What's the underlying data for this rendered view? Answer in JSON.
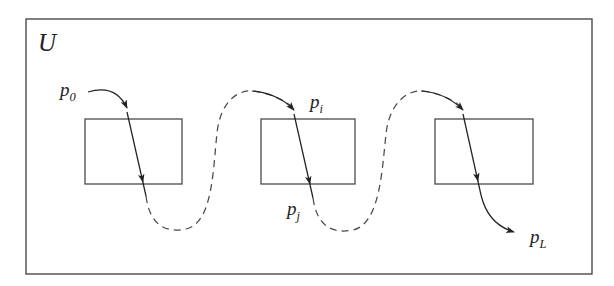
{
  "figure": {
    "type": "diagram",
    "background_color": "#ffffff",
    "stroke_color": "#222222",
    "outer_region": {
      "label": "U",
      "label_x": 38,
      "label_y": 51,
      "x": 26,
      "y": 19,
      "width": 566,
      "height": 255
    },
    "boxes": [
      {
        "name": "box-1",
        "x": 85,
        "y": 119,
        "width": 97,
        "height": 65
      },
      {
        "name": "box-2",
        "x": 261,
        "y": 119,
        "width": 94,
        "height": 65
      },
      {
        "name": "box-3",
        "x": 435,
        "y": 119,
        "width": 98,
        "height": 65
      }
    ],
    "point_labels": [
      {
        "name": "p0",
        "base": "p",
        "sub": "0",
        "x": 60,
        "y": 96
      },
      {
        "name": "pi",
        "base": "p",
        "sub": "i",
        "x": 310,
        "y": 108
      },
      {
        "name": "pj",
        "base": "p",
        "sub": "j",
        "x": 287,
        "y": 215
      },
      {
        "name": "pL",
        "base": "p",
        "sub": "L",
        "x": 530,
        "y": 243
      }
    ],
    "path_segments": [
      {
        "name": "entry-curve-1",
        "style": "solid",
        "d": "M 88 92 C 108 86 120 93 127 108",
        "arrowhead": {
          "x": 129,
          "y": 117,
          "angle": 68
        }
      },
      {
        "name": "crossing-1",
        "style": "solid",
        "d": "M 127 108 L 146 196",
        "arrowhead": {
          "x": 142,
          "y": 177,
          "angle": 78
        }
      },
      {
        "name": "dashed-loop-1",
        "style": "dashed",
        "d": "M 146 196 C 150 226 166 233 186 229 C 213 223 213 169 217 133 C 220 104 236 89 254 91 C 268 93 283 99 294 110"
      },
      {
        "name": "crossing-2",
        "style": "solid",
        "d": "M 294 110 L 313 198",
        "arrowhead": {
          "x": 309,
          "y": 179,
          "angle": 78
        }
      },
      {
        "name": "dashed-loop-2",
        "style": "dashed",
        "d": "M 313 198 C 317 227 333 234 353 230 C 380 224 382 170 386 134 C 389 105 406 89 424 91 C 438 93 452 99 463 110"
      },
      {
        "name": "crossing-3",
        "style": "solid",
        "d": "M 463 110 L 481 195",
        "arrowhead": {
          "x": 477,
          "y": 176,
          "angle": 78
        }
      },
      {
        "name": "exit-curve",
        "style": "solid",
        "d": "M 481 195 C 486 216 497 227 515 232",
        "arrowhead": {
          "x": 521,
          "y": 233,
          "angle": 18
        }
      }
    ],
    "arrowheads_note": "Solid filled triangular arrowheads along the trajectory",
    "dash_pattern": "7 5"
  }
}
